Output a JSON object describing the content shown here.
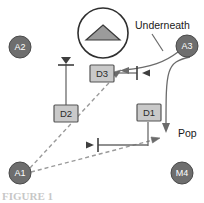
{
  "figure": {
    "type": "dataflow-diagram",
    "background_color": "#ffffff",
    "caption_partial": "FIGURE 1",
    "colors": {
      "actor_fill": "#6e6e6e",
      "actor_stroke": "#4a4a4a",
      "actor_text": "#ffffff",
      "store_fill": "#c9c9c9",
      "store_stroke": "#555555",
      "store_text": "#2b2b2b",
      "solid_line": "#6b6b6b",
      "dashed_line": "#9a9a9a",
      "icon_fill": "#9b9b9b",
      "icon_stroke": "#3a3a3a",
      "label_text": "#1a1a1a"
    }
  },
  "actors": [
    {
      "id": "A2",
      "label": "A2",
      "cx": 20,
      "cy": 47,
      "r": 11
    },
    {
      "id": "A3",
      "label": "A3",
      "cx": 187,
      "cy": 46,
      "r": 11
    },
    {
      "id": "A1",
      "label": "A1",
      "cx": 20,
      "cy": 173,
      "r": 11
    },
    {
      "id": "M4",
      "label": "M4",
      "cx": 182,
      "cy": 173,
      "r": 11
    }
  ],
  "stores": [
    {
      "id": "D3",
      "label": "D3",
      "x": 90,
      "y": 65,
      "w": 24,
      "h": 17
    },
    {
      "id": "D2",
      "label": "D2",
      "x": 54,
      "y": 105,
      "w": 24,
      "h": 17
    },
    {
      "id": "D1",
      "label": "D1",
      "x": 137,
      "y": 104,
      "w": 24,
      "h": 17
    }
  ],
  "icon": {
    "name": "triangle-in-circle-icon",
    "cx": 103,
    "cy": 33,
    "r": 25,
    "triangle_half_width": 17,
    "triangle_height": 15
  },
  "labels": [
    {
      "id": "underneath",
      "text": "Underneath",
      "x": 135,
      "y": 26
    },
    {
      "id": "pop",
      "text": "Pop",
      "x": 178,
      "y": 134
    }
  ],
  "connectors": [
    {
      "id": "underneath-leader",
      "style": "solid",
      "from": "Underneath label",
      "to": "curve from A3"
    },
    {
      "id": "a3-to-d3-curve",
      "style": "solid",
      "from": "A3",
      "to": "D3 inbound arrow"
    },
    {
      "id": "d3-horizontal",
      "style": "solid",
      "from": "D3",
      "to": "tick marker"
    },
    {
      "id": "a3-to-pop",
      "style": "solid",
      "from": "A3",
      "to": "Pop"
    },
    {
      "id": "d2-vertical",
      "style": "solid",
      "from": "tick above D2",
      "to": "D2"
    },
    {
      "id": "d1-vertical",
      "style": "solid",
      "from": "D1",
      "to": "lower horizontal line"
    },
    {
      "id": "lower-horizontal",
      "style": "solid",
      "from": "tick marker",
      "to": "D1 riser"
    },
    {
      "id": "a1-to-d3",
      "style": "dashed",
      "from": "A1",
      "to": "D3 arrow"
    },
    {
      "id": "a1-to-d1",
      "style": "dashed",
      "from": "A1",
      "to": "D1 arrow"
    }
  ]
}
